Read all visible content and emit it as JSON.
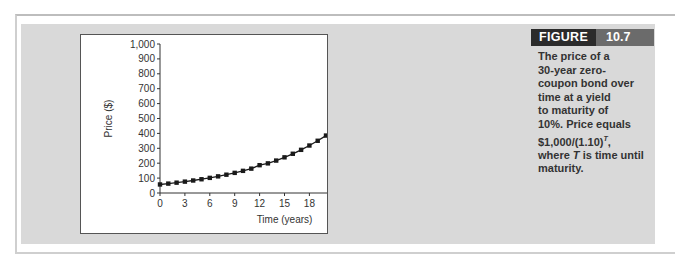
{
  "figure": {
    "label": "FIGURE",
    "number": "10.7",
    "caption_lines": [
      "The price of a",
      "30-year zero-",
      "coupon bond over",
      "time at a yield",
      "to maturity of",
      "10%. Price equals"
    ],
    "caption_formula": "$1,000/(1.10)",
    "caption_formula_exponent": "T",
    "caption_formula_suffix": ",",
    "caption_where_prefix": "where ",
    "caption_where_var": "T",
    "caption_where_suffix": " is time until",
    "caption_last": "maturity."
  },
  "chart_data": {
    "type": "line",
    "title": "",
    "xlabel": "Time (years)",
    "ylabel": "Price ($)",
    "xlim": [
      0,
      30
    ],
    "ylim": [
      0,
      1000
    ],
    "x_ticks": [
      0,
      3,
      6,
      9,
      12,
      15,
      18,
      21,
      24,
      27,
      30
    ],
    "y_ticks": [
      0,
      100,
      200,
      300,
      400,
      500,
      600,
      700,
      800,
      900,
      1000
    ],
    "y_tick_labels": [
      "0",
      "100",
      "200",
      "300",
      "400",
      "500",
      "600",
      "700",
      "800",
      "900",
      "1,000"
    ],
    "grid": false,
    "legend": null,
    "series": [
      {
        "name": "Bond price",
        "marker": "square",
        "x": [
          0,
          1,
          2,
          3,
          4,
          5,
          6,
          7,
          8,
          9,
          10,
          11,
          12,
          13,
          14,
          15,
          16,
          17,
          18,
          19,
          20,
          21,
          22,
          23,
          24,
          25,
          26,
          27,
          28,
          29,
          30
        ],
        "values": [
          57.31,
          63.04,
          69.34,
          76.28,
          83.91,
          92.3,
          101.53,
          111.68,
          122.85,
          135.13,
          148.64,
          163.51,
          186.63,
          198.84,
          217.63,
          239.39,
          263.33,
          289.66,
          318.63,
          350.49,
          385.54,
          424.1,
          466.51,
          513.16,
          564.47,
          620.92,
          683.01,
          751.31,
          826.45,
          909.09,
          1000.0
        ]
      }
    ]
  }
}
